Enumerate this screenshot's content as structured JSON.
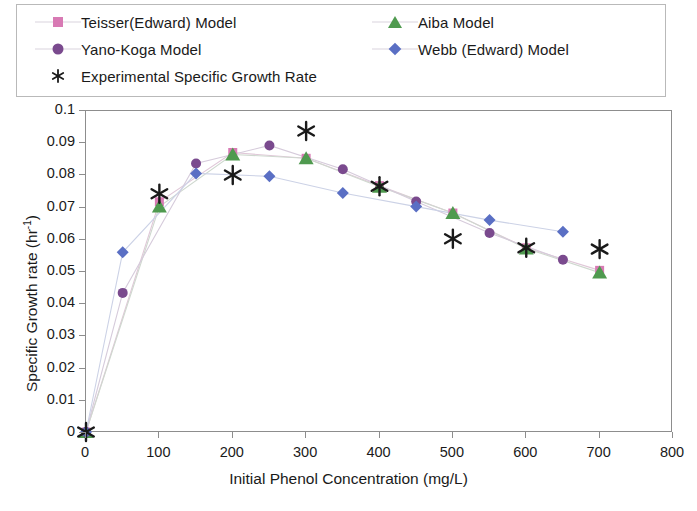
{
  "legend": {
    "entries": [
      {
        "label": "Teisser(Edward) Model",
        "marker": "square",
        "color": "#d87ab4",
        "icon_name": "legend-marker-square-pink"
      },
      {
        "label": "Aiba Model",
        "marker": "triangle",
        "color": "#4f9a4f",
        "icon_name": "legend-marker-triangle-green"
      },
      {
        "label": "Yano-Koga Model",
        "marker": "circle",
        "color": "#7a4a8e",
        "icon_name": "legend-marker-circle-purple"
      },
      {
        "label": "Webb (Edward) Model",
        "marker": "diamond",
        "color": "#5a6fc4",
        "icon_name": "legend-marker-diamond-blue"
      },
      {
        "label": "Experimental Specific Growth Rate",
        "marker": "asterisk",
        "color": "#1a1a1a",
        "icon_name": "legend-marker-asterisk-black"
      }
    ]
  },
  "chart_data": {
    "type": "scatter",
    "title": "",
    "xlabel": "Initial Phenol Concentration (mg/L)",
    "ylabel": "Specific Growth rate (hr-1)",
    "ylabel_display": "Specific Growth rate (hr",
    "ylabel_sup": "-1",
    "ylabel_tail": ")",
    "xlim": [
      0,
      800
    ],
    "ylim": [
      0,
      0.1
    ],
    "xticks": [
      0,
      100,
      200,
      300,
      400,
      500,
      600,
      700,
      800
    ],
    "xtick_labels": [
      "0",
      "100",
      "200",
      "300",
      "400",
      "500",
      "600",
      "700",
      "800"
    ],
    "yticks": [
      0,
      0.01,
      0.02,
      0.03,
      0.04,
      0.05,
      0.06,
      0.07,
      0.08,
      0.09,
      0.1
    ],
    "ytick_labels": [
      "0",
      "0.01",
      "0.02",
      "0.03",
      "0.04",
      "0.05",
      "0.06",
      "0.07",
      "0.08",
      "0.09",
      "0.1"
    ],
    "grid": false,
    "legend_position": "top",
    "series": [
      {
        "name": "Teisser(Edward) Model",
        "marker": "square",
        "color": "#d87ab4",
        "line_color": "#e0c8d8",
        "x": [
          0,
          100,
          200,
          300,
          400,
          500,
          600,
          700
        ],
        "y": [
          0,
          0.0715,
          0.0868,
          0.085,
          0.0765,
          0.068,
          0.0572,
          0.0502
        ]
      },
      {
        "name": "Aiba Model",
        "marker": "triangle",
        "color": "#4f9a4f",
        "line_color": "#cfd8cf",
        "x": [
          0,
          100,
          200,
          300,
          400,
          500,
          600,
          700
        ],
        "y": [
          0,
          0.07,
          0.0862,
          0.085,
          0.0762,
          0.068,
          0.057,
          0.0495
        ]
      },
      {
        "name": "Yano-Koga Model",
        "marker": "circle",
        "color": "#7a4a8e",
        "line_color": "#d6cbdb",
        "x": [
          0,
          50,
          150,
          250,
          350,
          450,
          550,
          650
        ],
        "y": [
          0,
          0.0432,
          0.0834,
          0.089,
          0.0816,
          0.0716,
          0.0618,
          0.0535
        ]
      },
      {
        "name": "Webb (Edward) Model",
        "marker": "diamond",
        "color": "#5a6fc4",
        "line_color": "#ccd2e6",
        "x": [
          0,
          50,
          150,
          250,
          350,
          450,
          550,
          650
        ],
        "y": [
          0,
          0.0558,
          0.0803,
          0.0794,
          0.0742,
          0.07,
          0.0658,
          0.0622
        ]
      },
      {
        "name": "Experimental Specific Growth Rate",
        "marker": "asterisk",
        "color": "#1a1a1a",
        "line_color": "none",
        "x": [
          0,
          100,
          200,
          300,
          400,
          500,
          600,
          700
        ],
        "y": [
          0,
          0.074,
          0.0798,
          0.0935,
          0.0763,
          0.06,
          0.0572,
          0.0568
        ]
      }
    ]
  }
}
